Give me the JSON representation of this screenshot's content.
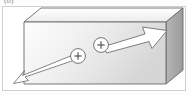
{
  "figure": {
    "label": "(b)",
    "type": "physics-diagram",
    "caption": ""
  },
  "colors": {
    "top_face": "#f4f4f4",
    "front_face_light": "#fbfbfb",
    "front_face_dark": "#d8d8d8",
    "side_face": "#a8a8a8",
    "outline": "#5a5a5a",
    "arrow_fill": "#ffffff",
    "arrow_stroke": "#6b6b6b",
    "frame_border": "#cfcfcf",
    "label_text": "#8a8a8a"
  },
  "slab": {
    "name": "rectangular-slab",
    "front_face": {
      "x": 24,
      "y": 22,
      "width": 142,
      "height": 62
    },
    "depth_x": 17,
    "depth_y": 14
  },
  "charges": [
    {
      "id": "charge-1",
      "sign": "+",
      "cx": 78,
      "cy": 56,
      "r": 7.5
    },
    {
      "id": "charge-2",
      "sign": "+",
      "cx": 101,
      "cy": 45,
      "r": 7.5
    }
  ],
  "arrows": [
    {
      "id": "arrow-down-left",
      "label": "+",
      "direction": "down-left",
      "from": {
        "x": 78,
        "y": 56
      },
      "to": {
        "x": 16,
        "y": 82
      },
      "head_size": "small",
      "description": "long thin outlined arrow from first charge toward lower-left"
    },
    {
      "id": "arrow-up-right",
      "label": "+",
      "direction": "up-right",
      "from": {
        "x": 101,
        "y": 45
      },
      "to": {
        "x": 166,
        "y": 22
      },
      "head_size": "large",
      "description": "thick outlined arrow from second charge toward upper-right"
    }
  ]
}
